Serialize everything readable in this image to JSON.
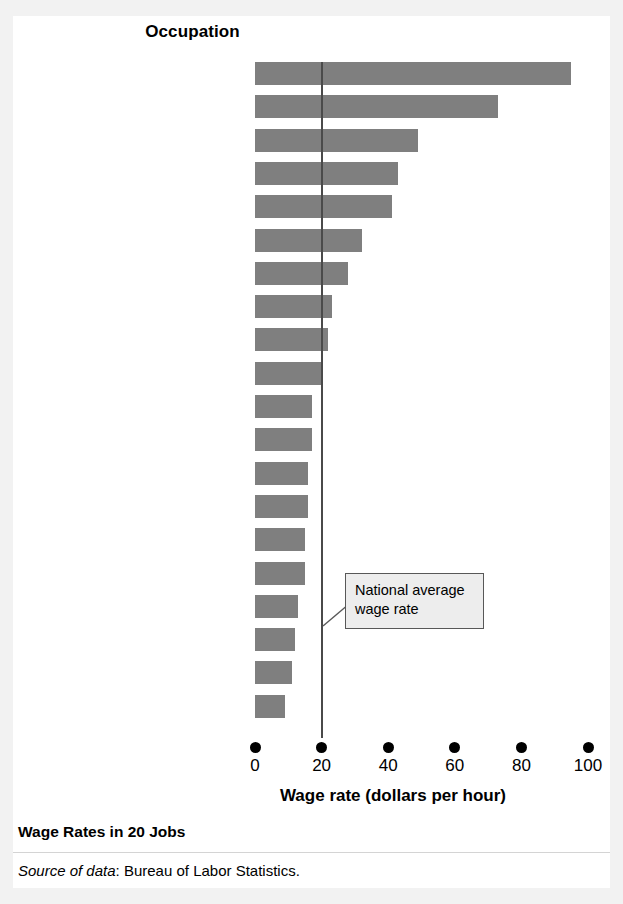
{
  "figure": {
    "caption": "Wage Rates in 20 Jobs",
    "source_label": "Source of data",
    "source_sep": ": ",
    "source_text": "Bureau of Labor Statistics.",
    "column_heading": "Occupation",
    "annotation": "National average wage rate"
  },
  "colors": {
    "bar_fill": "#7f7f7f",
    "average_line": "#4a4a4a",
    "callout_fill": "#ededed",
    "callout_border": "#585858",
    "panel_bg": "#ffffff",
    "page_bg": "#f2f2f2",
    "text": "#000000"
  },
  "chart_data": {
    "type": "bar",
    "orientation": "horizontal",
    "title": "Wage Rates in 20 Jobs",
    "xlabel": "Wage rate (dollars per hour)",
    "ylabel": "Occupation",
    "xlim": [
      0,
      100
    ],
    "xticks": [
      0,
      20,
      40,
      60,
      80,
      100
    ],
    "xtick_labels": [
      "0",
      "20",
      "40",
      "60",
      "80",
      "100"
    ],
    "grid": false,
    "legend": false,
    "categories": [
      "Surgeons",
      "Dentists",
      "Air traffic controllers",
      "Economists",
      "Financial analysts",
      "Technical writers",
      "Real estate sales agents",
      "Computer support specialists",
      "Crane operators",
      "Truck drivers",
      "Travel guides",
      "Fitness trainers",
      "Word processors and typists",
      "Construction laborers",
      "Van drivers",
      "Medical assistants",
      "Retail salespersons",
      "Bank tellers",
      "Motion picture projectionists",
      "Fast-food workers"
    ],
    "values": [
      95,
      73,
      49,
      43,
      41,
      32,
      28,
      23,
      22,
      20,
      17,
      17,
      16,
      16,
      15,
      15,
      13,
      12,
      11,
      9
    ],
    "annotations": [
      {
        "text": "National average wage rate",
        "type": "vertical-reference-line",
        "x_value": 20
      }
    ]
  }
}
